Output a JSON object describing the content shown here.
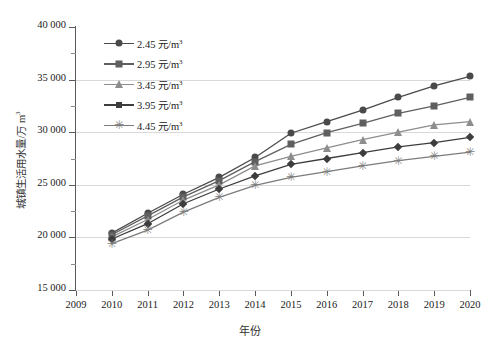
{
  "chart": {
    "type": "line",
    "xlabel": "年份",
    "ylabel": "城镇生活用水量/万 m³",
    "ylabel_main": "城镇生活用水量/万 m",
    "ylabel_sup": "3",
    "ytick_labels": [
      "40 000",
      "35 000",
      "30 000",
      "25 000",
      "20 000",
      "15 000"
    ],
    "xtick_labels": [
      "2009",
      "2010",
      "2011",
      "2012",
      "2013",
      "2014",
      "2015",
      "2016",
      "2017",
      "2018",
      "2019",
      "2020"
    ],
    "legend_position": "upper-left-inside",
    "grid": "horizontal-major"
  },
  "colors": {
    "series_1": "#4a4a4a",
    "series_2": "#5f5f5f",
    "series_3": "#8d8d8d",
    "series_4": "#3d3d3d",
    "series_5": "#7c7c7c",
    "grid": "#d9d9d9",
    "axis": "#5a5a5a"
  },
  "chart_data": {
    "type": "line",
    "title": "",
    "xlabel": "年份",
    "ylabel": "城镇生活用水量/万 m³",
    "x": [
      2010,
      2011,
      2012,
      2013,
      2014,
      2015,
      2016,
      2017,
      2018,
      2019,
      2020
    ],
    "xlim": [
      2009,
      2020
    ],
    "ylim": [
      15000,
      40000
    ],
    "ytick_step": 5000,
    "grid": true,
    "legend": [
      "2.45 元/m³",
      "2.95 元/m³",
      "3.45 元/m³",
      "3.95 元/m³",
      "4.45 元/m³"
    ],
    "series": [
      {
        "name": "2.45 元/m³",
        "marker": "circle",
        "color": "#4a4a4a",
        "values": [
          20400,
          22300,
          24100,
          25700,
          27600,
          29900,
          31000,
          32100,
          33300,
          34400,
          35300
        ]
      },
      {
        "name": "2.95 元/m³",
        "marker": "square",
        "color": "#5f5f5f",
        "values": [
          20250,
          22050,
          23850,
          25400,
          27200,
          28850,
          29950,
          30850,
          31800,
          32500,
          33300
        ]
      },
      {
        "name": "3.45 元/m³",
        "marker": "triangle",
        "color": "#8d8d8d",
        "values": [
          20050,
          21700,
          23550,
          25000,
          26800,
          27700,
          28500,
          29300,
          30000,
          30700,
          31000
        ]
      },
      {
        "name": "3.95 元/m³",
        "marker": "diamond",
        "color": "#3d3d3d",
        "values": [
          19850,
          21300,
          23200,
          24600,
          25850,
          26950,
          27500,
          28050,
          28600,
          29000,
          29500
        ]
      },
      {
        "name": "4.45 元/m³",
        "marker": "star",
        "color": "#7c7c7c",
        "values": [
          19400,
          20700,
          22400,
          23800,
          24950,
          25700,
          26250,
          26800,
          27300,
          27700,
          28100
        ]
      }
    ]
  }
}
